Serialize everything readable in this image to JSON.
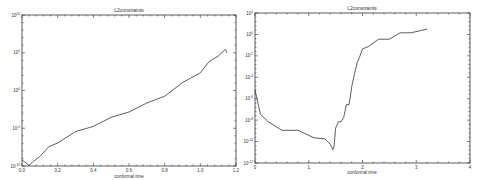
{
  "chart_data": [
    {
      "type": "line",
      "title": "L2constraints",
      "xlabel": "conformal time",
      "ylabel": "",
      "yscale": "log",
      "xlim": [
        0,
        1.2
      ],
      "ylim_exp": [
        -10,
        10
      ],
      "x_ticks": [
        "0.0",
        "0.2",
        "0.4",
        "0.6",
        "0.8",
        "1.0",
        "1.2"
      ],
      "y_ticks": [
        "10^-10",
        "10^-5",
        "10^0",
        "10^5",
        "10^10"
      ],
      "grid": false,
      "series": [
        {
          "name": "L2constraints",
          "x": [
            0.0,
            0.02,
            0.04,
            0.06,
            0.1,
            0.15,
            0.2,
            0.3,
            0.4,
            0.5,
            0.6,
            0.7,
            0.8,
            0.9,
            1.0,
            1.05,
            1.1,
            1.14,
            1.15
          ],
          "log10y": [
            -9.2,
            -9.7,
            -9.8,
            -9.6,
            -8.6,
            -7.6,
            -6.8,
            -5.6,
            -4.6,
            -3.7,
            -2.7,
            -1.8,
            -0.6,
            0.9,
            2.5,
            3.7,
            4.7,
            5.3,
            5.0
          ]
        }
      ]
    },
    {
      "type": "line",
      "title": "L2constraints",
      "xlabel": "conformal time",
      "ylabel": "",
      "yscale": "log",
      "xlim": [
        0,
        4
      ],
      "ylim_exp": [
        -12,
        2
      ],
      "x_ticks": [
        "0",
        "1",
        "2",
        "3",
        "4"
      ],
      "y_ticks": [
        "10^-12",
        "10^-10",
        "10^-8",
        "10^-6",
        "10^-4",
        "10^-2",
        "10^0",
        "10^2"
      ],
      "grid": false,
      "series": [
        {
          "name": "L2constraints",
          "x": [
            0.0,
            0.03,
            0.1,
            0.25,
            0.5,
            0.8,
            1.1,
            1.3,
            1.4,
            1.45,
            1.47,
            1.5,
            1.55,
            1.6,
            1.65,
            1.7,
            1.75,
            1.8,
            1.85,
            1.9,
            1.95,
            2.0,
            2.1,
            2.3,
            2.5,
            2.7,
            2.9,
            3.2
          ],
          "log10y": [
            -5.2,
            -6.0,
            -7.3,
            -8.3,
            -8.8,
            -9.1,
            -9.5,
            -9.9,
            -10.1,
            -10.9,
            -10.3,
            -8.9,
            -8.0,
            -8.3,
            -7.6,
            -6.7,
            -6.4,
            -5.0,
            -3.6,
            -2.8,
            -1.9,
            -1.5,
            -1.0,
            -0.6,
            -0.3,
            0.0,
            0.3,
            0.5
          ]
        }
      ]
    }
  ],
  "left": {
    "title": "L2constraints",
    "xlabel": "conformal time",
    "x_ticks": [
      "0.0",
      "0.2",
      "0.4",
      "0.6",
      "0.8",
      "1.0",
      "1.2"
    ],
    "y_ticks": [
      "10",
      "10",
      "10",
      "10",
      "10"
    ],
    "y_exps": [
      "-10",
      "-5",
      "0",
      "5",
      "10"
    ]
  },
  "right": {
    "title": "L2constraints",
    "xlabel": "conformal time",
    "x_ticks": [
      "0",
      "1",
      "2",
      "3",
      "4"
    ],
    "y_ticks": [
      "10",
      "10",
      "10",
      "10",
      "10",
      "10",
      "10",
      "10"
    ],
    "y_exps": [
      "-12",
      "-10",
      "-8",
      "-6",
      "-4",
      "-2",
      "0",
      "2"
    ]
  }
}
